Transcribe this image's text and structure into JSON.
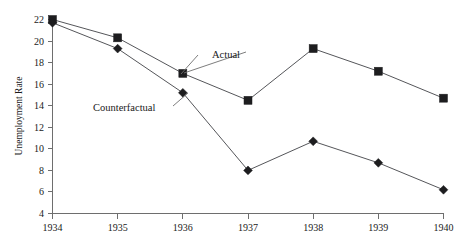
{
  "chart_data": {
    "type": "line",
    "title": "",
    "xlabel": "",
    "ylabel": "Unemployment Rate",
    "categories": [
      "1934",
      "1935",
      "1936",
      "1937",
      "1938",
      "1939",
      "1940"
    ],
    "x": [
      1934,
      1935,
      1936,
      1937,
      1938,
      1939,
      1940
    ],
    "ylim": [
      4,
      22
    ],
    "xlim": [
      1934,
      1940
    ],
    "y_ticks": [
      4,
      6,
      8,
      10,
      12,
      14,
      16,
      18,
      20,
      22
    ],
    "y_tick_labels": [
      "4",
      "6",
      "8",
      "10",
      "12",
      "14",
      "16",
      "18",
      "20",
      "22"
    ],
    "x_ticks": [
      1934,
      1935,
      1936,
      1937,
      1938,
      1939,
      1940
    ],
    "x_tick_labels": [
      "1934",
      "1935",
      "1936",
      "1937",
      "1938",
      "1939",
      "1940"
    ],
    "grid": false,
    "legend": "none",
    "series": [
      {
        "name": "Actual",
        "marker": "square",
        "color": "#1d1d1f",
        "values": [
          22.0,
          20.3,
          17.0,
          14.5,
          19.3,
          17.2,
          14.7
        ]
      },
      {
        "name": "Counterfactual",
        "marker": "diamond",
        "color": "#1d1d1f",
        "values": [
          21.7,
          19.3,
          15.2,
          8.0,
          10.7,
          8.7,
          6.2
        ]
      }
    ],
    "annotations": [
      {
        "text": "Actual",
        "series": "Actual",
        "anchor_year": 1936,
        "anchor_value": 17.0
      },
      {
        "text": "Counterfactual",
        "series": "Counterfactual",
        "anchor_year": 1936,
        "anchor_value": 15.2
      }
    ]
  },
  "axis": {
    "y_title": "Unemployment Rate"
  },
  "labels": {
    "actual": "Actual",
    "counterfactual": "Counterfactual"
  }
}
